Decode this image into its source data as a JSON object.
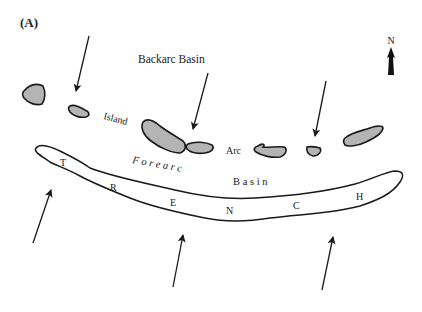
{
  "panel_label": "(A)",
  "north": {
    "label": "N"
  },
  "labels": {
    "backarc_basin": "Backarc Basin",
    "island": "Island",
    "arc": "Arc",
    "forearc": "F o r e a r c",
    "basin": "B a s i n"
  },
  "trench_letters": [
    "T",
    "R",
    "E",
    "N",
    "C",
    "H"
  ],
  "colors": {
    "island_fill": "#b4b4b4",
    "outline": "#1a1a1a",
    "background": "#ffffff"
  }
}
